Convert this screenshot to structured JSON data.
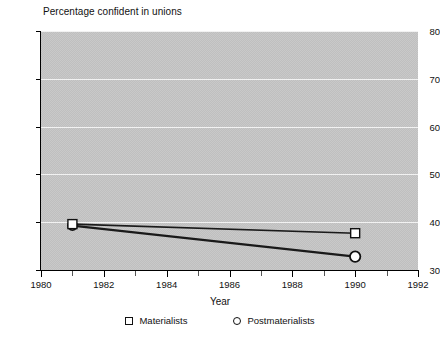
{
  "chart_data": {
    "type": "line",
    "title": "Percentage confident in unions",
    "xlabel": "Year",
    "ylabel": "",
    "x": [
      1981,
      1990
    ],
    "xlim": [
      1980,
      1992
    ],
    "ylim": [
      30,
      80
    ],
    "xticks": [
      1980,
      1982,
      1984,
      1986,
      1988,
      1990,
      1992
    ],
    "yticks": [
      30,
      40,
      50,
      60,
      70,
      80
    ],
    "grid": "horizontal",
    "legend_position": "bottom",
    "series": [
      {
        "name": "Materialists",
        "marker": "square",
        "values": [
          39.6,
          37.7
        ]
      },
      {
        "name": "Postmaterialists",
        "marker": "circle",
        "values": [
          39.3,
          32.8
        ]
      }
    ]
  },
  "legend": {
    "items": [
      {
        "label": "Materialists",
        "marker": "square"
      },
      {
        "label": "Postmaterialists",
        "marker": "circle"
      }
    ]
  },
  "colors": {
    "plot_background": "#c9c9c9",
    "gridline": "#f2f2f2",
    "axis": "#000000",
    "line": "#1a1a1a",
    "marker_fill": "#ffffff"
  },
  "axis_titles": {
    "x": "Year",
    "top_left": "Percentage confident in unions"
  },
  "tick_labels": {
    "y": [
      "30",
      "40",
      "50",
      "60",
      "70",
      "80"
    ],
    "x": [
      "1980",
      "1982",
      "1984",
      "1986",
      "1988",
      "1990",
      "1992"
    ]
  }
}
